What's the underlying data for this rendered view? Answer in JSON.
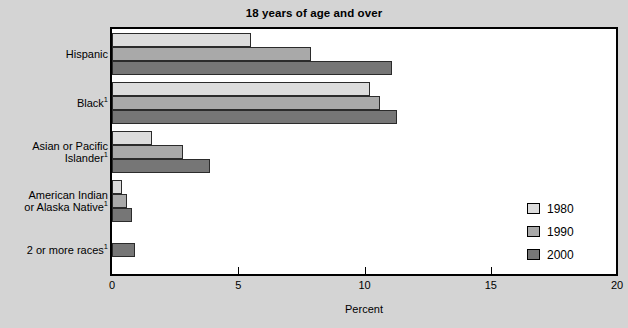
{
  "chart_data": {
    "type": "bar",
    "orientation": "horizontal",
    "title": "18 years of age and over",
    "xlabel": "Percent",
    "ylabel": "",
    "xlim": [
      0,
      20
    ],
    "xticks": [
      "0",
      "5",
      "10",
      "15",
      "20"
    ],
    "grid": false,
    "legend_position": "right-inside",
    "categories": [
      "Hispanic",
      "Black",
      "Asian or Pacific Islander",
      "American Indian or Alaska Native",
      "2 or more races"
    ],
    "category_labels": [
      {
        "lines": [
          "Hispanic"
        ],
        "footnote": ""
      },
      {
        "lines": [
          "Black"
        ],
        "footnote": "1"
      },
      {
        "lines": [
          "Asian or Pacific",
          "Islander"
        ],
        "footnote": "1"
      },
      {
        "lines": [
          "American Indian",
          "or Alaska Native"
        ],
        "footnote": "1"
      },
      {
        "lines": [
          "2 or more races"
        ],
        "footnote": "1"
      }
    ],
    "series": [
      {
        "name": "1980",
        "color": "#dcdcdc",
        "values": [
          5.5,
          10.2,
          1.6,
          0.4,
          null
        ]
      },
      {
        "name": "1990",
        "color": "#a9a9a9",
        "values": [
          7.9,
          10.6,
          2.8,
          0.6,
          null
        ]
      },
      {
        "name": "2000",
        "color": "#767676",
        "values": [
          11.1,
          11.3,
          3.9,
          0.8,
          0.9
        ]
      }
    ]
  },
  "legend": {
    "entries": [
      {
        "label": "1980",
        "color": "#dcdcdc"
      },
      {
        "label": "1990",
        "color": "#a9a9a9"
      },
      {
        "label": "2000",
        "color": "#767676"
      }
    ]
  },
  "axis": {
    "x_title": "Percent",
    "x_tick_labels": [
      "0",
      "5",
      "10",
      "15",
      "20"
    ]
  },
  "colors": {
    "page_background": "#d4d4d4",
    "plot_background": "#ffffff",
    "frame": "#000000",
    "series_1980": "#dcdcdc",
    "series_1990": "#a9a9a9",
    "series_2000": "#767676"
  }
}
